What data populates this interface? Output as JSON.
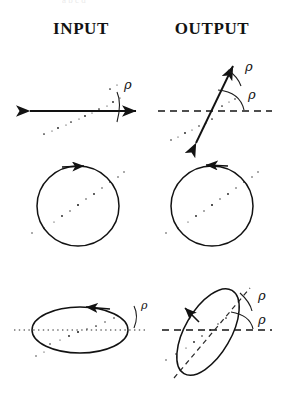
{
  "figure": {
    "background_color": "#ffffff",
    "ink_color": "#121212",
    "columns": [
      {
        "id": "input",
        "label": "INPUT"
      },
      {
        "id": "output",
        "label": "OUTPUT"
      }
    ],
    "angle_symbol": "ρ",
    "top_cropped_text": "a b c d"
  },
  "rows": [
    {
      "id": "row-linear",
      "state": "linear polarization",
      "input": {
        "shape": "double-headed-arrow",
        "orientation_deg": 0,
        "reference_line": "none",
        "speckle_diagonal_deg": 30,
        "angle_labels": [
          {
            "symbol": "ρ",
            "x": 124,
            "y": 84
          }
        ],
        "arc_count": 1
      },
      "output": {
        "shape": "double-headed-arrow",
        "orientation_deg": 70,
        "reference_line": "dashed-horizontal",
        "speckle_diagonal_deg": 30,
        "angle_labels": [
          {
            "symbol": "ρ",
            "x": 247,
            "y": 64
          },
          {
            "symbol": "ρ",
            "x": 249,
            "y": 91
          }
        ],
        "arc_count": 2
      }
    },
    {
      "id": "row-circular",
      "state": "circular polarization",
      "input": {
        "shape": "circle",
        "handedness": "clockwise",
        "arrow_position": "top",
        "speckle_diagonal_deg": 30,
        "angle_labels": [],
        "arc_count": 0
      },
      "output": {
        "shape": "circle",
        "handedness": "counter-clockwise",
        "arrow_position": "top",
        "speckle_diagonal_deg": 30,
        "angle_labels": [],
        "arc_count": 0
      }
    },
    {
      "id": "row-elliptical",
      "state": "elliptical polarization",
      "input": {
        "shape": "ellipse",
        "orientation_deg": 0,
        "handedness": "counter-clockwise",
        "reference_line": "dotted-horizontal",
        "angle_labels": [
          {
            "symbol": "ρ",
            "x": 141,
            "y": 303
          }
        ],
        "arc_count": 1
      },
      "output": {
        "shape": "ellipse",
        "orientation_deg": 60,
        "handedness": "counter-clockwise",
        "reference_line": "dashed-horizontal",
        "major_axis": "dashed",
        "angle_labels": [
          {
            "symbol": "ρ",
            "x": 259,
            "y": 293
          },
          {
            "symbol": "ρ",
            "x": 259,
            "y": 316
          }
        ],
        "arc_count": 2
      }
    }
  ]
}
